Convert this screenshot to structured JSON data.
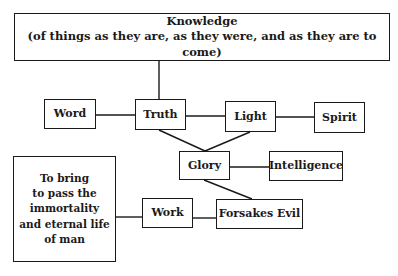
{
  "diagram": {
    "nodes": {
      "knowledge": {
        "title": "Knowledge",
        "subtitle": "(of things as they are, as they were, and as they are to come)"
      },
      "word": {
        "label": "Word"
      },
      "truth": {
        "label": "Truth"
      },
      "light": {
        "label": "Light"
      },
      "spirit": {
        "label": "Spirit"
      },
      "glory": {
        "label": "Glory"
      },
      "intelligence": {
        "label": "Intelligence"
      },
      "purpose": {
        "lines": [
          "To bring",
          "to pass the",
          "immortality",
          "and eternal life",
          "of man"
        ]
      },
      "work": {
        "label": "Work"
      },
      "forsakes_evil": {
        "label": "Forsakes Evil"
      }
    },
    "edges": [
      {
        "from": "knowledge",
        "to": "truth"
      },
      {
        "from": "word",
        "to": "truth"
      },
      {
        "from": "truth",
        "to": "light"
      },
      {
        "from": "light",
        "to": "spirit"
      },
      {
        "from": "truth",
        "to": "glory"
      },
      {
        "from": "light",
        "to": "glory"
      },
      {
        "from": "glory",
        "to": "intelligence"
      },
      {
        "from": "glory",
        "to": "forsakes_evil"
      },
      {
        "from": "work",
        "to": "forsakes_evil"
      },
      {
        "from": "purpose",
        "to": "work"
      }
    ],
    "colors": {
      "stroke": "#1a1a1a",
      "background": "#ffffff"
    }
  }
}
